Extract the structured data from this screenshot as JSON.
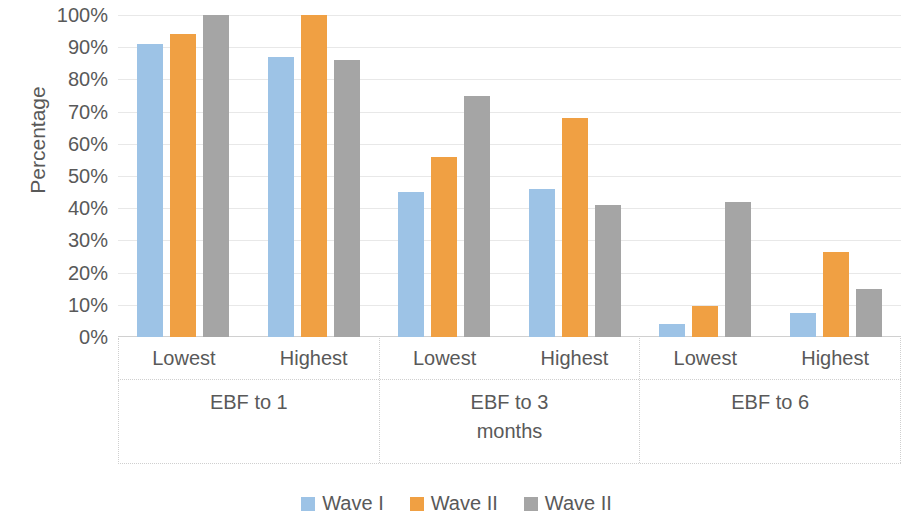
{
  "chart_data": {
    "type": "bar",
    "title": "",
    "xlabel": "",
    "ylabel": "Percentage",
    "ylim": [
      0,
      100
    ],
    "grid": true,
    "legend_position": "bottom",
    "categories": [
      "Lowest",
      "Highest",
      "Lowest",
      "Highest",
      "Lowest",
      "Highest"
    ],
    "groups": [
      {
        "label": "EBF to 1",
        "label_lines": [
          "EBF to 1"
        ],
        "categories": [
          "Lowest",
          "Highest"
        ]
      },
      {
        "label": "EBF to 3 months",
        "label_lines": [
          "EBF to 3",
          "months"
        ],
        "categories": [
          "Lowest",
          "Highest"
        ]
      },
      {
        "label": "EBF to 6",
        "label_lines": [
          "EBF to 6"
        ],
        "categories": [
          "Lowest",
          "Highest"
        ]
      }
    ],
    "series": [
      {
        "name": "Wave I",
        "color": "#9dc3e6",
        "values": [
          91,
          87,
          45,
          46,
          4,
          7.5
        ]
      },
      {
        "name": "Wave II",
        "color": "#f0a043",
        "values": [
          94,
          100,
          56,
          68,
          9.5,
          26.5
        ]
      },
      {
        "name": "Wave II",
        "color": "#a5a5a5",
        "values": [
          100,
          86,
          75,
          41,
          42,
          15
        ]
      }
    ],
    "y_ticks": [
      {
        "value": 100,
        "label": "100%"
      },
      {
        "value": 90,
        "label": "90%"
      },
      {
        "value": 80,
        "label": "80%"
      },
      {
        "value": 70,
        "label": "70%"
      },
      {
        "value": 60,
        "label": "60%"
      },
      {
        "value": 50,
        "label": "50%"
      },
      {
        "value": 40,
        "label": "40%"
      },
      {
        "value": 30,
        "label": "30%"
      },
      {
        "value": 20,
        "label": "20%"
      },
      {
        "value": 10,
        "label": "10%"
      },
      {
        "value": 0,
        "label": "0%"
      }
    ]
  },
  "legend": {
    "items": [
      {
        "label": "Wave I",
        "color": "#9dc3e6"
      },
      {
        "label": "Wave II",
        "color": "#f0a043"
      },
      {
        "label": "Wave II",
        "color": "#a5a5a5"
      }
    ]
  },
  "axis": {
    "y_title": "Percentage"
  }
}
